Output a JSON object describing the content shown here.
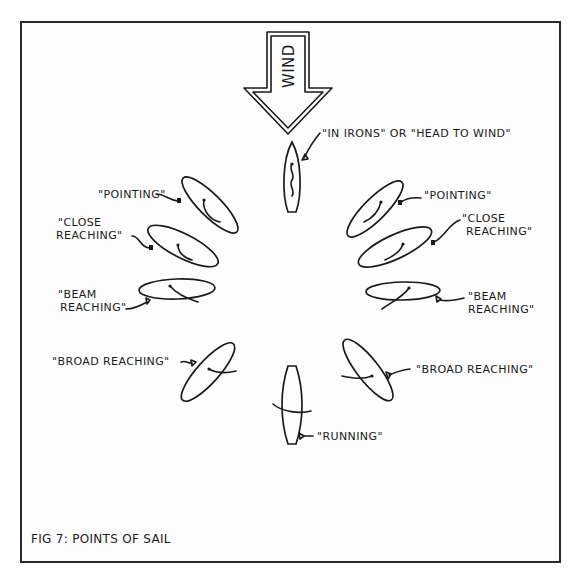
{
  "figure": {
    "caption": "FIG 7: POINTS OF SAIL",
    "wind_label": "WIND",
    "ink_color": "#1a1a1a",
    "background_color": "#fdfdfd"
  },
  "labels": {
    "in_irons": "\"IN IRONS\" OR \"HEAD TO WIND\"",
    "pointing_left": "\"POINTING\"",
    "pointing_right": "\"POINTING\"",
    "close_reaching_left": [
      "\"CLOSE",
      "REACHING\""
    ],
    "close_reaching_right": [
      "\"CLOSE",
      "REACHING\""
    ],
    "beam_reaching_left": [
      "\"BEAM",
      "REACHING\""
    ],
    "beam_reaching_right": [
      "\"BEAM",
      "REACHING\""
    ],
    "broad_reaching_left": "\"BROAD REACHING\"",
    "broad_reaching_right": "\"BROAD REACHING\"",
    "running": "\"RUNNING\""
  },
  "points_of_sail": [
    {
      "name": "In irons / head to wind",
      "side": "center",
      "angle_deg": 0
    },
    {
      "name": "Pointing",
      "side": "both",
      "angle_deg": 45
    },
    {
      "name": "Close reaching",
      "side": "both",
      "angle_deg": 60
    },
    {
      "name": "Beam reaching",
      "side": "both",
      "angle_deg": 90
    },
    {
      "name": "Broad reaching",
      "side": "both",
      "angle_deg": 135
    },
    {
      "name": "Running",
      "side": "center",
      "angle_deg": 180
    }
  ]
}
